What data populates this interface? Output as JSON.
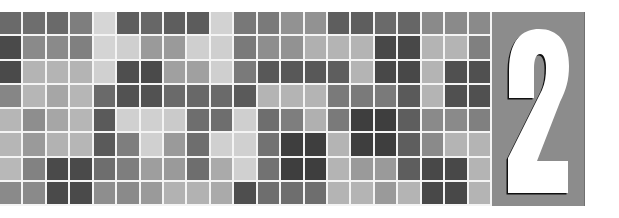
{
  "chapter": {
    "number": "2",
    "numeral_color": "#ffffff",
    "shadow_color": "#111111",
    "panel_color": "#8c8c8c"
  },
  "mosaic": {
    "rows": 8,
    "cols": 21,
    "origin": [
      0,
      12
    ],
    "col_pitch": 23.43,
    "row_pitch": 24.25,
    "gap": 2,
    "gap_color": "#f4f4f4",
    "cells": [
      [
        "#6a6a6a",
        "#6e6e6e",
        "#6a6a6a",
        "#7e7e7e",
        "#d6d6d6",
        "#5e5e5e",
        "#676767",
        "#5e5e5e",
        "#5c5c5c",
        "#d2d2d2",
        "#787878",
        "#7a7a7a",
        "#929292",
        "#929292",
        "#5e5e5e",
        "#5e5e5e",
        "#6a6a6a",
        "#666666",
        "#8a8a8a",
        "#8a8a8a",
        "#8a8a8a"
      ],
      [
        "#4a4a4a",
        "#8a8a8a",
        "#8a8a8a",
        "#808080",
        "#d4d4d4",
        "#cfcfcf",
        "#9a9a9a",
        "#9a9a9a",
        "#cfcfcf",
        "#cfcfcf",
        "#7a7a7a",
        "#8e8e8e",
        "#929292",
        "#b0b0b0",
        "#b4b4b4",
        "#b4b4b4",
        "#484848",
        "#484848",
        "#b4b4b4",
        "#b4b4b4",
        "#808080"
      ],
      [
        "#4a4a4a",
        "#b4b4b4",
        "#b4b4b4",
        "#b4b4b4",
        "#d0d0d0",
        "#4e4e4e",
        "#4a4a4a",
        "#a0a0a0",
        "#a0a0a0",
        "#cfcfcf",
        "#7a7a7a",
        "#585858",
        "#585858",
        "#585858",
        "#5e5e5e",
        "#b4b4b4",
        "#484848",
        "#484848",
        "#b4b4b4",
        "#505050",
        "#505050"
      ],
      [
        "#868686",
        "#b6b6b6",
        "#a6a6a6",
        "#b6b6b6",
        "#6a6a6a",
        "#525252",
        "#525252",
        "#6a6a6a",
        "#686868",
        "#6a6a6a",
        "#5a5a5a",
        "#b4b4b4",
        "#b4b4b4",
        "#b4b4b4",
        "#7a7a7a",
        "#7a7a7a",
        "#7a7a7a",
        "#5a5a5a",
        "#b4b4b4",
        "#505050",
        "#505050"
      ],
      [
        "#b6b6b6",
        "#8e8e8e",
        "#a6a6a6",
        "#b6b6b6",
        "#5a5a5a",
        "#d0d0d0",
        "#d0d0d0",
        "#cacaca",
        "#6e6e6e",
        "#6e6e6e",
        "#cfcfcf",
        "#6e6e6e",
        "#7e7e7e",
        "#b0b0b0",
        "#7a7a7a",
        "#3e3e3e",
        "#3e3e3e",
        "#5e5e5e",
        "#8a8a8a",
        "#8a8a8a",
        "#808080"
      ],
      [
        "#b6b6b6",
        "#9a9a9a",
        "#b2b2b2",
        "#b6b6b6",
        "#5a5a5a",
        "#7e7e7e",
        "#d0d0d0",
        "#9a9a9a",
        "#6e6e6e",
        "#d0d0d0",
        "#d0d0d0",
        "#727272",
        "#3e3e3e",
        "#3e3e3e",
        "#b4b4b4",
        "#3e3e3e",
        "#3e3e3e",
        "#5e5e5e",
        "#8a8a8a",
        "#b4b4b4",
        "#b4b4b4"
      ],
      [
        "#b8b8b8",
        "#828282",
        "#4a4a4a",
        "#4a4a4a",
        "#6e6e6e",
        "#7e7e7e",
        "#9e9e9e",
        "#9a9a9a",
        "#6e6e6e",
        "#aaaaaa",
        "#d0d0d0",
        "#727272",
        "#3e3e3e",
        "#3e3e3e",
        "#b4b4b4",
        "#9a9a9a",
        "#9a9a9a",
        "#5e5e5e",
        "#484848",
        "#484848",
        "#b4b4b4"
      ],
      [
        "#8a8a8a",
        "#8a8a8a",
        "#4a4a4a",
        "#4a4a4a",
        "#8e8e8e",
        "#8a8a8a",
        "#9a9a9a",
        "#b2b2b2",
        "#b2b2b2",
        "#aaaaaa",
        "#4e4e4e",
        "#6e6e6e",
        "#6e6e6e",
        "#6e6e6e",
        "#b4b4b4",
        "#b4b4b4",
        "#9a9a9a",
        "#b4b4b4",
        "#484848",
        "#484848",
        "#b4b4b4"
      ]
    ]
  }
}
